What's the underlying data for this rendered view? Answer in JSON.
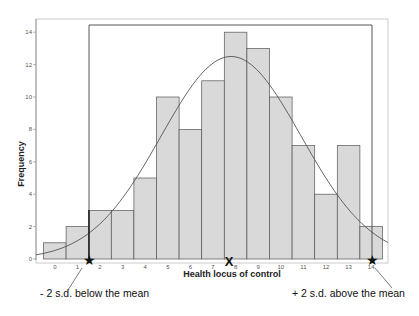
{
  "chart_data": {
    "type": "bar",
    "title": "",
    "xlabel": "Health locus of control",
    "ylabel": "Frequency",
    "categories": [
      "0",
      "1",
      "2",
      "3",
      "4",
      "5",
      "6",
      "7",
      "8",
      "9",
      "10",
      "11",
      "12",
      "13",
      "14"
    ],
    "values": [
      1,
      2,
      3,
      3,
      5,
      10,
      8,
      11,
      14,
      13,
      10,
      7,
      4,
      7,
      2
    ],
    "yticks": [
      0,
      2,
      4,
      6,
      8,
      10,
      12,
      14
    ],
    "ylim": [
      0,
      14.5
    ],
    "grid": false,
    "bar_color": "#d9d9d9",
    "bar_edge_color": "#555555",
    "normal_curve": {
      "mean": 7.8,
      "peak_frequency": 12.5,
      "sd": 3.1
    },
    "annotations": [
      {
        "text": "- 2 s.d. below the mean",
        "marker": "star",
        "x": 1.6
      },
      {
        "text": "X",
        "marker": "mean",
        "x": 7.8
      },
      {
        "text": "+ 2 s.d. above the mean",
        "marker": "star",
        "x": 14.0
      }
    ]
  },
  "labels": {
    "ylabel": "Frequency",
    "xlabel": "Health locus of control",
    "lower_annotation": "- 2 s.d. below the mean",
    "upper_annotation": "+ 2 s.d. above the mean",
    "mean_marker": "X",
    "star_marker": "★"
  }
}
